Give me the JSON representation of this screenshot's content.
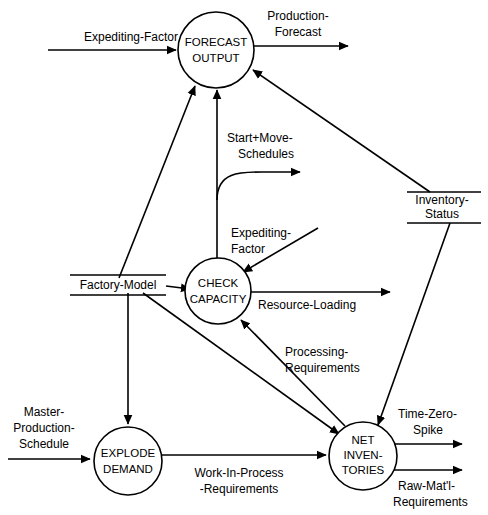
{
  "diagram": {
    "type": "data-flow-diagram",
    "title": "",
    "processes": [
      {
        "id": "forecast-output",
        "label_lines": [
          "FORECAST",
          "OUTPUT"
        ],
        "cx": 216,
        "cy": 50,
        "r": 38
      },
      {
        "id": "check-capacity",
        "label_lines": [
          "CHECK",
          "CAPACITY"
        ],
        "cx": 218,
        "cy": 291,
        "r": 33
      },
      {
        "id": "explode-demand",
        "label_lines": [
          "EXPLODE",
          "DEMAND"
        ],
        "cx": 128,
        "cy": 461,
        "r": 34
      },
      {
        "id": "net-inventories",
        "label_lines": [
          "NET",
          "INVEN-",
          "TORIES"
        ],
        "cx": 363,
        "cy": 456,
        "r": 34
      }
    ],
    "stores": [
      {
        "id": "factory-model",
        "label_lines": [
          "Factory-Model"
        ],
        "cx": 118,
        "cy": 285,
        "width": 96
      },
      {
        "id": "inventory-status",
        "label_lines": [
          "Inventory-",
          "Status"
        ],
        "cx": 442,
        "cy": 208,
        "width": 74
      }
    ],
    "flows": [
      {
        "id": "expediting-factor-to-forecast",
        "label_lines": [
          "Expediting-Factor"
        ]
      },
      {
        "id": "production-forecast",
        "label_lines": [
          "Production-",
          "Forecast"
        ]
      },
      {
        "id": "start-move-schedules",
        "label_lines": [
          "Start+Move-",
          "Schedules"
        ]
      },
      {
        "id": "expediting-factor-to-capacity",
        "label_lines": [
          "Expediting-",
          "Factor"
        ]
      },
      {
        "id": "resource-loading",
        "label_lines": [
          "Resource-Loading"
        ]
      },
      {
        "id": "processing-requirements",
        "label_lines": [
          "Processing-",
          "Requirements"
        ]
      },
      {
        "id": "master-production-schedule",
        "label_lines": [
          "Master-",
          "Production-",
          "Schedule"
        ]
      },
      {
        "id": "work-in-process-requirements",
        "label_lines": [
          "Work-In-Process",
          "-Requirements"
        ]
      },
      {
        "id": "time-zero-spike",
        "label_lines": [
          "Time-Zero-",
          "Spike"
        ]
      },
      {
        "id": "raw-matl-requirements",
        "label_lines": [
          "Raw-Mat'l-",
          "Requirements"
        ]
      }
    ],
    "colors": {
      "stroke": "#000000",
      "background": "#ffffff",
      "text": "#000000"
    }
  }
}
